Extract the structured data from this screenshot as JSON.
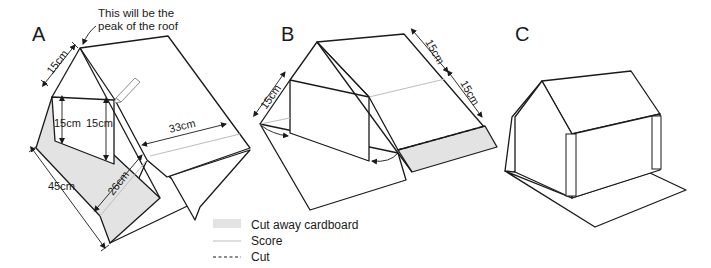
{
  "figure": {
    "panels": [
      {
        "id": "A",
        "label": "A",
        "annotation": {
          "line1": "This will be the",
          "line2": "peak of the roof"
        },
        "dimensions": {
          "top_edge": "15cm",
          "left_height": "15cm",
          "right_height": "15cm",
          "roof_width": "33cm",
          "length": "45cm",
          "cutaway_width": "26cm"
        }
      },
      {
        "id": "B",
        "label": "B",
        "dimensions": {
          "left_edge": "15cm",
          "right_upper": "15cm",
          "right_lower": "15cm"
        }
      },
      {
        "id": "C",
        "label": "C"
      }
    ],
    "legend": {
      "items": [
        {
          "key": "cutaway",
          "label": "Cut away cardboard",
          "swatch_color": "#e3e3e3"
        },
        {
          "key": "score",
          "label": "Score",
          "line_color": "#bdbdbd"
        },
        {
          "key": "cut",
          "label": "Cut",
          "line_style": "dashed"
        }
      ]
    },
    "colors": {
      "line": "#1a1a1a",
      "shade": "#e3e3e3",
      "score": "#bdbdbd",
      "background": "#ffffff"
    }
  }
}
